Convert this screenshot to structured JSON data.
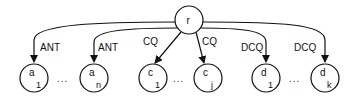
{
  "diagram": {
    "root": {
      "label": "r"
    },
    "edges": [
      {
        "label": "ANT",
        "target": "a1"
      },
      {
        "label": "ANT",
        "target": "an"
      },
      {
        "label": "CQ",
        "target": "c1"
      },
      {
        "label": "CQ",
        "target": "cj"
      },
      {
        "label": "DCQ",
        "target": "d1"
      },
      {
        "label": "DCQ",
        "target": "dk"
      }
    ],
    "nodes": [
      {
        "id": "a1",
        "base": "a",
        "sub": "1"
      },
      {
        "id": "an",
        "base": "a",
        "sub": "n"
      },
      {
        "id": "c1",
        "base": "c",
        "sub": "1"
      },
      {
        "id": "cj",
        "base": "c",
        "sub": "j"
      },
      {
        "id": "d1",
        "base": "d",
        "sub": "1"
      },
      {
        "id": "dk",
        "base": "d",
        "sub": "k"
      }
    ],
    "ellipsis": "..."
  }
}
